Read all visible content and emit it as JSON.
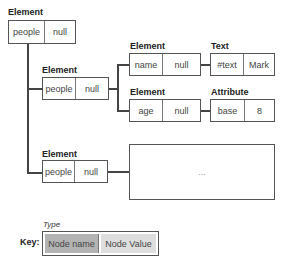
{
  "diagram": {
    "root": {
      "type": "Element",
      "name": "people",
      "value": "null"
    },
    "child1": {
      "type": "Element",
      "name": "people",
      "value": "null"
    },
    "child1_a": {
      "type": "Element",
      "name": "name",
      "value": "null"
    },
    "child1_a_text": {
      "type": "Text",
      "name": "#text",
      "value": "Mark"
    },
    "child1_b": {
      "type": "Element",
      "name": "age",
      "value": "null"
    },
    "child1_b_attr": {
      "type": "Attribute",
      "name": "base",
      "value": "8"
    },
    "child2": {
      "type": "Element",
      "name": "people",
      "value": "null"
    },
    "child2_placeholder": "...",
    "key": {
      "label": "Key:",
      "type": "Type",
      "name": "Node name",
      "value": "Node Value",
      "name_color": "#b3b3b3",
      "value_color": "#dedede"
    }
  }
}
